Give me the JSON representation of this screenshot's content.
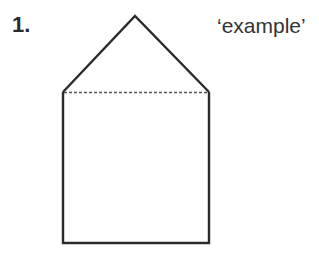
{
  "item_number": "1.",
  "caption": "‘example’",
  "shape": {
    "description": "house shape: triangle roof on top of a rectangle, separated by dotted line",
    "stroke_color": "#2b2b2b",
    "dotted_color": "#555555",
    "apex": [
      135,
      16
    ],
    "left_shoulder": [
      63,
      92
    ],
    "right_shoulder": [
      209,
      92
    ],
    "bottom_left": [
      63,
      243
    ],
    "bottom_right": [
      209,
      243
    ]
  }
}
